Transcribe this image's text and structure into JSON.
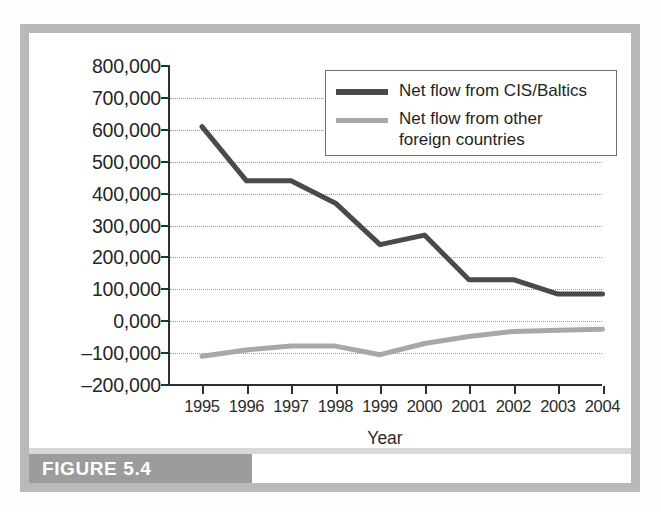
{
  "figure": {
    "caption": "FIGURE 5.4",
    "caption_band_color": "#9c9c9c",
    "frame_color": "#b9b9b9"
  },
  "legend": {
    "position": "top-right-inside-plot",
    "entries": [
      {
        "label": "Net flow from CIS/Baltics",
        "color": "#4a4a4a"
      },
      {
        "label": "Net flow from other\nforeign countries",
        "color": "#a8a8a8"
      }
    ]
  },
  "axes": {
    "x_title": "Year",
    "y_tick_labels": [
      "800,000",
      "700,000",
      "600,000",
      "500,000",
      "400,000",
      "300,000",
      "200,000",
      "100,000",
      "0,000",
      "–100,000",
      "–200,000"
    ],
    "x_tick_labels": [
      "1995",
      "1996",
      "1997",
      "1998",
      "1999",
      "2000",
      "2001",
      "2002",
      "2003",
      "2004"
    ]
  },
  "chart_data": {
    "type": "line",
    "title": "FIGURE 5.4",
    "xlabel": "Year",
    "ylabel": "",
    "x": [
      1995,
      1996,
      1997,
      1998,
      1999,
      2000,
      2001,
      2002,
      2003,
      2004
    ],
    "categories": [
      "1995",
      "1996",
      "1997",
      "1998",
      "1999",
      "2000",
      "2001",
      "2002",
      "2003",
      "2004"
    ],
    "ylim": [
      -200000,
      800000
    ],
    "ytick_step": 100000,
    "yticks": [
      800000,
      700000,
      600000,
      500000,
      400000,
      300000,
      200000,
      100000,
      0,
      -100000,
      -200000
    ],
    "grid": true,
    "grid_style": "dotted-horizontal",
    "legend_position": "upper right",
    "series": [
      {
        "name": "Net flow from CIS/Baltics",
        "color": "#4a4a4a",
        "line_width": 5,
        "values": [
          610000,
          440000,
          440000,
          370000,
          240000,
          270000,
          130000,
          130000,
          85000,
          85000
        ]
      },
      {
        "name": "Net flow from other foreign countries",
        "color": "#a8a8a8",
        "line_width": 5,
        "values": [
          -110000,
          -90000,
          -78000,
          -78000,
          -105000,
          -70000,
          -48000,
          -32000,
          -28000,
          -25000
        ]
      }
    ]
  }
}
